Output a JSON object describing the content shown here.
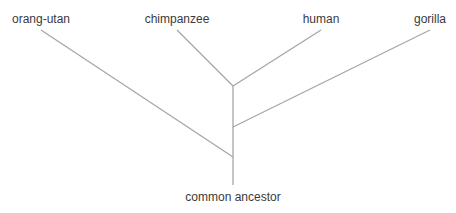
{
  "diagram": {
    "type": "phylogenetic-tree",
    "line_color": "#a6a6a6",
    "text_color": "#3a3a3a",
    "leaves": [
      {
        "id": "orang-utan",
        "label": "orang-utan"
      },
      {
        "id": "chimpanzee",
        "label": "chimpanzee"
      },
      {
        "id": "human",
        "label": "human"
      },
      {
        "id": "gorilla",
        "label": "gorilla"
      }
    ],
    "root": {
      "id": "common-ancestor",
      "label": "common ancestor"
    },
    "topology": "(orang-utan,(gorilla,(chimpanzee,human)))"
  }
}
